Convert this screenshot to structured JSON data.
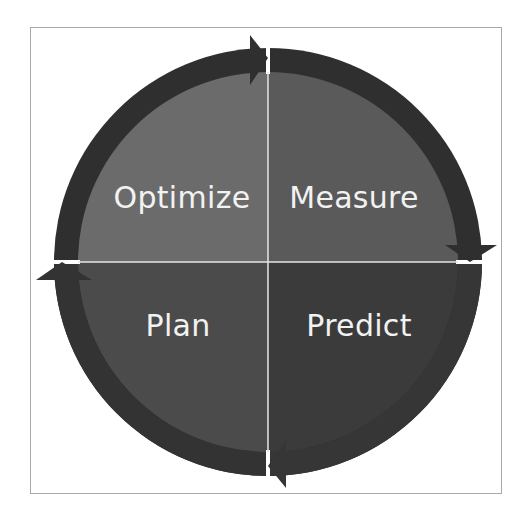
{
  "diagram": {
    "type": "cycle",
    "title": "",
    "direction": "clockwise",
    "quadrants": [
      {
        "position": "top-left",
        "label": "Optimize",
        "color": "#6b6b6b"
      },
      {
        "position": "top-right",
        "label": "Measure",
        "color": "#5a5a5a"
      },
      {
        "position": "bottom-left",
        "label": "Plan",
        "color": "#4b4b4b"
      },
      {
        "position": "bottom-right",
        "label": "Predict",
        "color": "#3b3b3b"
      }
    ],
    "ring_color": "#2f2f2f",
    "divider_color": "#e6e6e6",
    "frame_color": "#a8a8a8"
  }
}
